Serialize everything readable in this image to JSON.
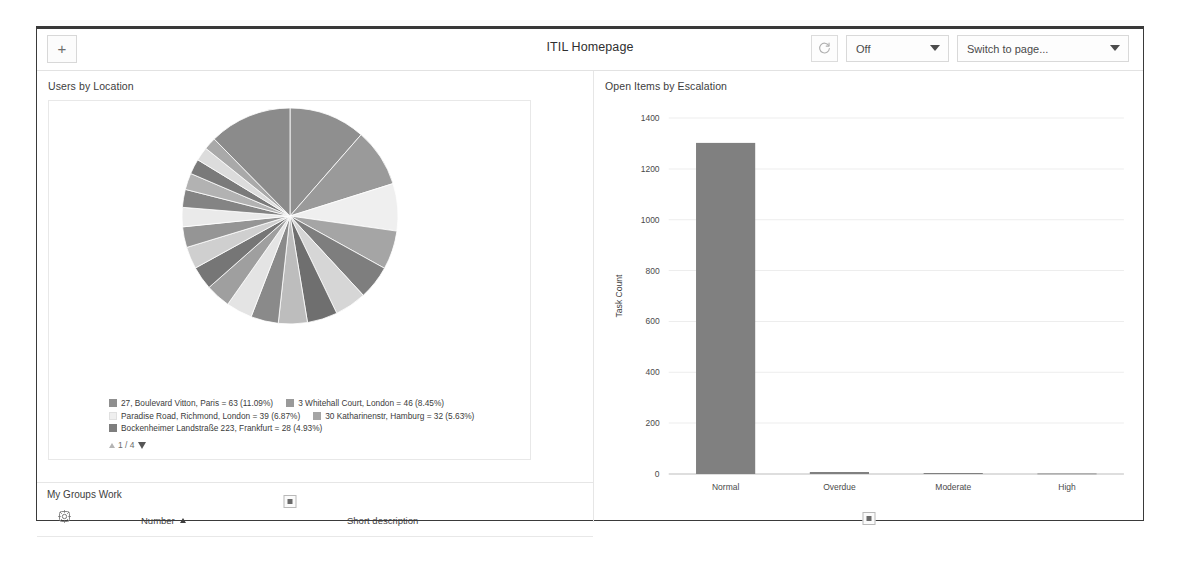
{
  "header": {
    "add_widget_label": "+",
    "title": "ITIL Homepage",
    "refresh_icon": "refresh-icon",
    "refresh_interval_value": "Off",
    "page_switcher_value": "Switch to page..."
  },
  "pie_widget": {
    "title": "Users by Location",
    "pager_text": "1 / 4",
    "expand_label": "expand-widget"
  },
  "bar_widget": {
    "title": "Open Items by Escalation",
    "expand_label": "expand-widget"
  },
  "groups_widget": {
    "title": "My Groups Work",
    "gear_icon": "gear-icon",
    "columns": [
      {
        "label": "Number",
        "sort": "asc"
      },
      {
        "label": "Short description",
        "sort": "none"
      }
    ]
  },
  "chart_data": [
    {
      "type": "pie",
      "title": "Users by Location",
      "legend_position": "bottom",
      "value_field": "users",
      "page": "1 / 4",
      "labels": [
        "27, Boulevard Vitton, Paris",
        "3 Whitehall Court, London",
        "Paradise Road, Richmond, London",
        "30 Katharinenstr, Hamburg",
        "Bockenheimer Landstraße 223, Frankfurt"
      ],
      "values": [
        63,
        46,
        39,
        32,
        28
      ],
      "percents": [
        11.09,
        8.45,
        6.87,
        5.63,
        4.93
      ],
      "legend_entries": [
        "27, Boulevard Vitton, Paris = 63 (11.09%)",
        "3 Whitehall Court, London = 46 (8.45%)",
        "Paradise Road, Richmond, London = 39 (6.87%)",
        "30 Katharinenstr, Hamburg = 32 (5.63%)",
        "Bockenheimer Landstraße 223, Frankfurt = 28 (4.93%)"
      ],
      "slice_colors": [
        "#8f8f8f",
        "#9a9a9a",
        "#efefef",
        "#a5a5a5",
        "#7e7e7e"
      ],
      "all_slice_percents": [
        11.09,
        8.45,
        6.87,
        5.63,
        4.93,
        4.6,
        4.4,
        4.2,
        4.0,
        3.8,
        3.6,
        3.4,
        3.2,
        3.0,
        2.8,
        2.6,
        2.4,
        2.2,
        2.0,
        1.8,
        12.0
      ]
    },
    {
      "type": "bar",
      "title": "Open Items by Escalation",
      "categories": [
        "Normal",
        "Overdue",
        "Moderate",
        "High"
      ],
      "values": [
        1302,
        8,
        4,
        2
      ],
      "xlabel": "",
      "ylabel": "Task Count",
      "ylim": [
        0,
        1400
      ],
      "yticks": [
        0,
        200,
        400,
        600,
        800,
        1000,
        1200,
        1400
      ],
      "grid": true,
      "bar_color": "#808080"
    }
  ]
}
